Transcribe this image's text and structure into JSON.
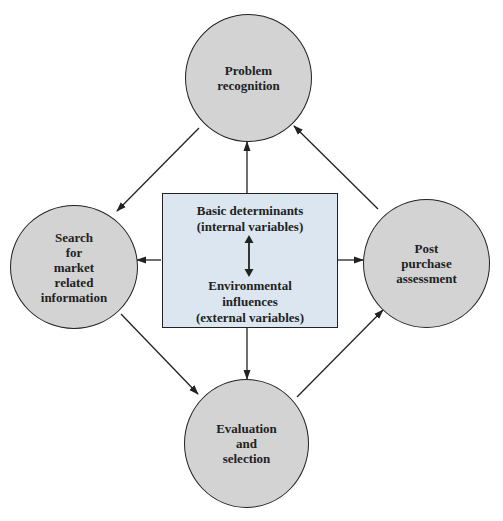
{
  "diagram": {
    "type": "cycle-with-central-influence",
    "colors": {
      "node_fill": "#d3d3d3",
      "center_fill": "#dbe6f0",
      "stroke": "#222222",
      "background": "#ffffff"
    },
    "nodes": {
      "top": {
        "label": "Problem\nrecognition"
      },
      "left": {
        "label": "Search\nfor\nmarket\nrelated\ninformation"
      },
      "right": {
        "label": "Post\npurchase\nassessment"
      },
      "bottom": {
        "label": "Evaluation\nand\nselection"
      }
    },
    "center": {
      "top_label": "Basic determinants\n(internal variables)",
      "bottom_label": "Environmental\ninfluences\n(external variables)",
      "relation": "bidirectional"
    },
    "edges": [
      {
        "from": "top",
        "to": "left"
      },
      {
        "from": "left",
        "to": "bottom"
      },
      {
        "from": "bottom",
        "to": "right"
      },
      {
        "from": "right",
        "to": "top"
      },
      {
        "from": "center",
        "to": "top"
      },
      {
        "from": "center",
        "to": "left"
      },
      {
        "from": "center",
        "to": "right"
      },
      {
        "from": "center",
        "to": "bottom"
      }
    ]
  }
}
